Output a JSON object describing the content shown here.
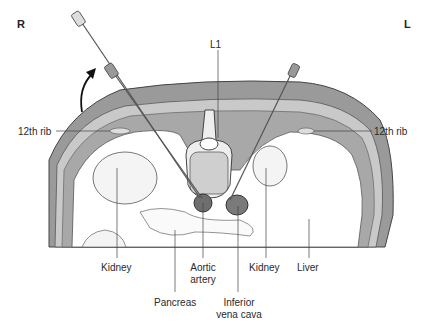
{
  "orientation": {
    "right": "R",
    "left": "L"
  },
  "labels": {
    "vertebra": "L1",
    "rib_right": "12th rib",
    "rib_left": "12th rib",
    "kidney_right": "Kidney",
    "aorta_line1": "Aortic",
    "aorta_line2": "artery",
    "kidney_left": "Kidney",
    "liver": "Liver",
    "pancreas": "Pancreas",
    "ivc_line1": "Inferior",
    "ivc_line2": "vena cava"
  },
  "colors": {
    "body_fill": "#8c8c8c",
    "muscle_fill": "#b0b0b0",
    "outline": "#444444",
    "vessel_fill": "#6e6e6e"
  }
}
